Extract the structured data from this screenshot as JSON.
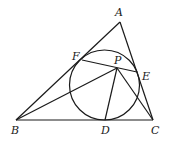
{
  "figure": {
    "stroke_color": "#1a1a1a",
    "background": "#ffffff"
  },
  "points": {
    "A": {
      "label": "A",
      "x": 120,
      "y": 22,
      "lx": 115,
      "ly": 16
    },
    "B": {
      "label": "B",
      "x": 16,
      "y": 120,
      "lx": 11,
      "ly": 134
    },
    "C": {
      "label": "C",
      "x": 153,
      "y": 120,
      "lx": 151,
      "ly": 134
    },
    "D": {
      "label": "D",
      "x": 105,
      "y": 120,
      "lx": 101,
      "ly": 134
    },
    "E": {
      "label": "E",
      "x": 137,
      "y": 72,
      "lx": 142,
      "ly": 80
    },
    "F": {
      "label": "F",
      "x": 82,
      "y": 60,
      "lx": 72,
      "ly": 60
    },
    "P": {
      "label": "P",
      "x": 117,
      "y": 68,
      "lx": 114,
      "ly": 64
    }
  },
  "circle": {
    "cx": 104.5,
    "cy": 85,
    "r": 35
  },
  "segments": [
    [
      "A",
      "B"
    ],
    [
      "B",
      "C"
    ],
    [
      "C",
      "A"
    ],
    [
      "F",
      "E"
    ],
    [
      "B",
      "P"
    ],
    [
      "P",
      "D"
    ],
    [
      "P",
      "C"
    ]
  ]
}
